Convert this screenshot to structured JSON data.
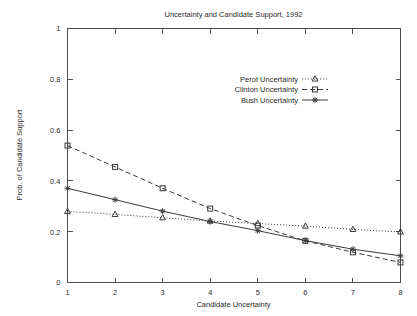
{
  "chart_data": {
    "type": "line",
    "title": "Uncertainty and Candidate Support, 1992",
    "xlabel": "Candidate Uncertainty",
    "ylabel": "Prob. of Candidate Support",
    "x": [
      1,
      2,
      3,
      4,
      5,
      6,
      7,
      8
    ],
    "xlim": [
      1,
      8
    ],
    "ylim": [
      0,
      1
    ],
    "xticks": [
      "1",
      "2",
      "3",
      "4",
      "5",
      "6",
      "7",
      "8"
    ],
    "yticks": [
      "0",
      "0.2",
      "0.4",
      "0.6",
      "0.8",
      "1"
    ],
    "ytick_values": [
      0,
      0.2,
      0.4,
      0.6,
      0.8,
      1
    ],
    "grid": false,
    "legend_position": "top-right-inside",
    "series": [
      {
        "name": "Perot Uncertainty",
        "values": [
          0.28,
          0.268,
          0.255,
          0.242,
          0.232,
          0.222,
          0.209,
          0.199
        ],
        "marker": "triangle",
        "linestyle": "dotted",
        "color": "#3a3a3a"
      },
      {
        "name": "Clinton Uncertainty",
        "values": [
          0.539,
          0.455,
          0.371,
          0.291,
          0.224,
          0.164,
          0.119,
          0.079
        ],
        "marker": "square",
        "linestyle": "dashed",
        "color": "#3a3a3a"
      },
      {
        "name": "Bush Uncertainty",
        "values": [
          0.371,
          0.326,
          0.281,
          0.24,
          0.204,
          0.165,
          0.131,
          0.105
        ],
        "marker": "asterisk",
        "linestyle": "solid",
        "color": "#3a3a3a"
      }
    ]
  },
  "colors": {
    "axis": "#4d4d4d",
    "text": "#2b2b2b",
    "series": "#3a3a3a",
    "background": "#ffffff"
  }
}
